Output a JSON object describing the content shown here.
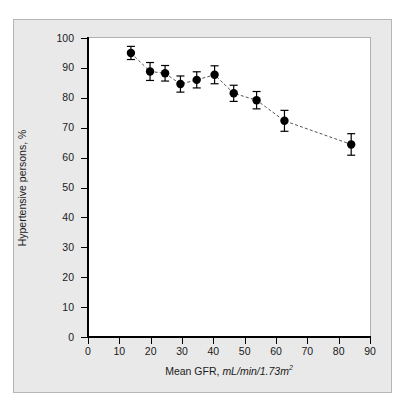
{
  "figure": {
    "background_color": "#ffffff",
    "panel_color": "#e9e9e9",
    "panel_border_color": "#b6b6b6",
    "plot_background_color": "#ffffff",
    "axis_color": "#000000",
    "marker_color": "#000000",
    "line_color": "#555555"
  },
  "axes": {
    "y_tick_labels": [
      "0",
      "10",
      "20",
      "30",
      "40",
      "50",
      "60",
      "70",
      "80",
      "90",
      "100"
    ],
    "x_tick_labels": [
      "0",
      "10",
      "20",
      "30",
      "40",
      "50",
      "60",
      "70",
      "80",
      "90"
    ],
    "y_label": "Hypertensive persons, %",
    "x_label_main": "Mean GFR, ",
    "x_label_units": "mL/min/1.73m",
    "x_label_units_exponent": "2"
  },
  "chart_data": {
    "type": "scatter",
    "title": "",
    "xlabel": "Mean GFR, mL/min/1.73m2",
    "ylabel": "Hypertensive persons, %",
    "xlim": [
      0,
      90
    ],
    "ylim": [
      0,
      100
    ],
    "xticks": [
      0,
      10,
      20,
      30,
      40,
      50,
      60,
      70,
      80,
      90
    ],
    "yticks": [
      0,
      10,
      20,
      30,
      40,
      50,
      60,
      70,
      80,
      90,
      100
    ],
    "grid": false,
    "legend": "none",
    "connector": "dashed-line",
    "error_bars": "vertical",
    "series": [
      {
        "name": "Hypertensive persons by mean GFR",
        "x": [
          13.7,
          19.8,
          24.6,
          29.5,
          34.7,
          40.4,
          46.5,
          53.8,
          62.7,
          84.0
        ],
        "y": [
          95.0,
          88.8,
          88.2,
          84.6,
          86.0,
          87.7,
          81.5,
          79.2,
          72.3,
          64.4
        ],
        "y_err_low": [
          2.2,
          3.0,
          2.6,
          2.7,
          2.7,
          3.0,
          2.7,
          2.9,
          3.5,
          3.6
        ],
        "y_err_high": [
          2.2,
          3.0,
          2.6,
          2.7,
          2.7,
          3.0,
          2.7,
          2.9,
          3.5,
          3.6
        ]
      }
    ]
  }
}
